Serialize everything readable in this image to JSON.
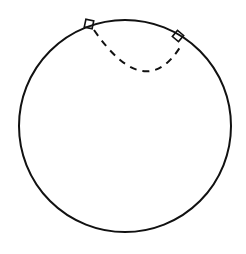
{
  "diagram": {
    "stroke_color": "#111111",
    "background": "#ffffff",
    "circle": {
      "cx": 125,
      "cy": 126,
      "r": 106
    },
    "dashed_arc": {
      "start": [
        94,
        30
      ],
      "end": [
        182,
        44
      ],
      "lowest_point": [
        142,
        71
      ],
      "dash_pattern": "7 6"
    },
    "right_angle_markers": [
      {
        "label": "right-angle-left",
        "x": 89,
        "y": 24,
        "size": 8,
        "rotation": 12
      },
      {
        "label": "right-angle-right",
        "x": 178,
        "y": 36,
        "size": 8,
        "rotation": 40
      }
    ]
  }
}
